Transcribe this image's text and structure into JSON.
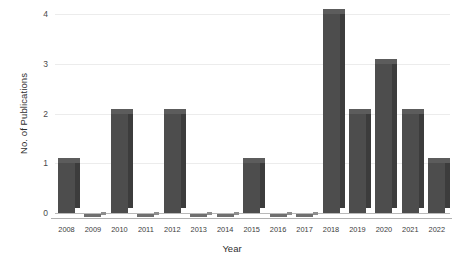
{
  "chart_data": {
    "type": "bar",
    "title": "",
    "subtitle": "",
    "xlabel": "Year",
    "ylabel": "No. of Publications",
    "categories": [
      "2008",
      "2009",
      "2010",
      "2011",
      "2012",
      "2013",
      "2014",
      "2015",
      "2016",
      "2017",
      "2018",
      "2019",
      "2020",
      "2021",
      "2022"
    ],
    "values": [
      1,
      0,
      2,
      0,
      2,
      0,
      0,
      1,
      0,
      0,
      4,
      2,
      3,
      2,
      1
    ],
    "series": [
      {
        "name": "No. of Publications",
        "values": [
          1,
          0,
          2,
          0,
          2,
          0,
          0,
          1,
          0,
          0,
          4,
          2,
          3,
          2,
          1
        ]
      }
    ],
    "ylim": [
      0,
      4
    ],
    "yticks": [
      "0",
      "1",
      "2",
      "3",
      "4"
    ],
    "ytick_values": [
      0,
      1,
      2,
      3,
      4
    ],
    "grid": true,
    "legend": false,
    "legend_position": "none",
    "bar_color": "#4d4d4d",
    "bar_side_color": "#3c3c3c",
    "bar_top_color": "#5c5c5c",
    "gridline_color": "#ececec",
    "axis_color": "#b0b0b0",
    "background_color": "#ffffff",
    "style": "3d-bar"
  },
  "axes": {
    "y_title": "No. of Publications",
    "x_title": "Year"
  }
}
